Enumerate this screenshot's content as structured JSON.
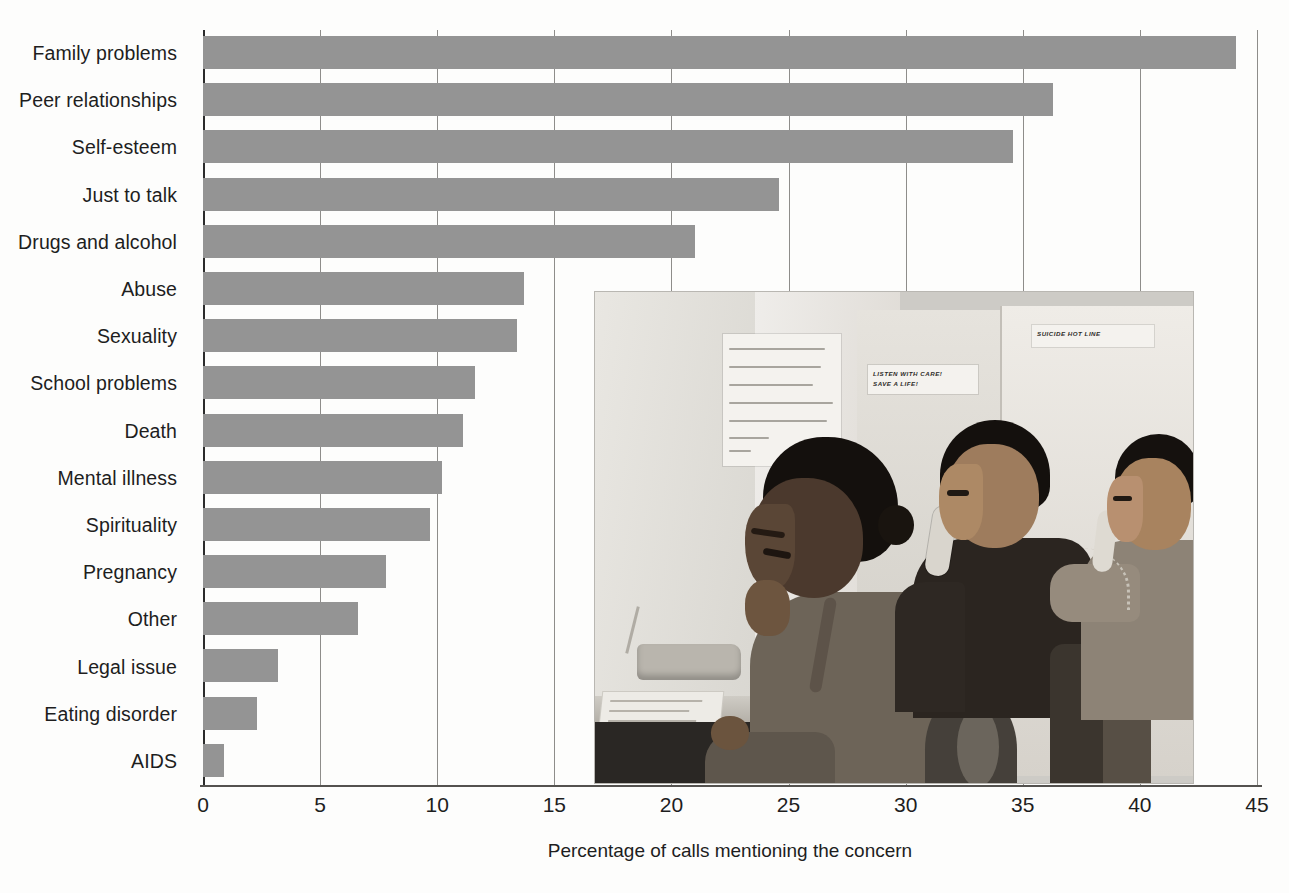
{
  "chart_data": {
    "type": "bar",
    "orientation": "horizontal",
    "title": "",
    "xlabel": "Percentage of calls mentioning the concern",
    "ylabel": "",
    "xlim": [
      0,
      45
    ],
    "xticks": [
      0,
      5,
      10,
      15,
      20,
      25,
      30,
      35,
      40,
      45
    ],
    "grid": "vertical",
    "legend": "none",
    "bar_color": "#949494",
    "categories": [
      "Family problems",
      "Peer relationships",
      "Self-esteem",
      "Just to talk",
      "Drugs and alcohol",
      "Abuse",
      "Sexuality",
      "School problems",
      "Death",
      "Mental illness",
      "Spirituality",
      "Pregnancy",
      "Other",
      "Legal issue",
      "Eating disorder",
      "AIDS"
    ],
    "values": [
      44.1,
      36.3,
      34.6,
      24.6,
      21.0,
      13.7,
      13.4,
      11.6,
      11.1,
      10.2,
      9.7,
      7.8,
      6.6,
      3.2,
      2.3,
      0.9
    ]
  },
  "photo": {
    "caption": "",
    "poem_note": "Razors pain you; Rivers are damp; Acids stain you; And drugs cause cramps. Guns aren't lawful; Nooses give; ...",
    "sign_1_line_1": "LISTEN WITH CARE!",
    "sign_1_line_2": "SAVE A LIFE!",
    "sign_2": "SUICIDE HOT LINE"
  }
}
